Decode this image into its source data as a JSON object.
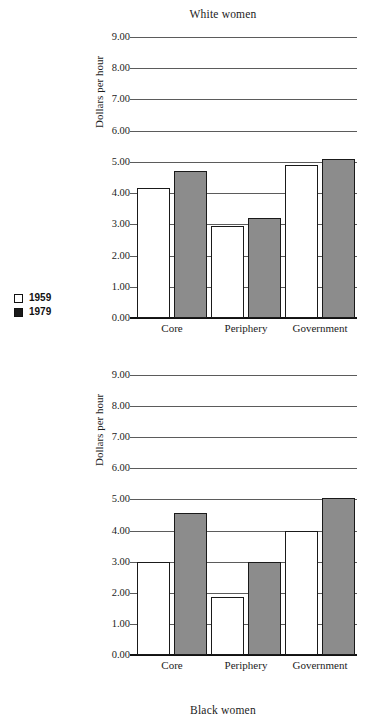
{
  "legend": {
    "entries": [
      {
        "label": "1959",
        "swatch": "open-square-icon",
        "fill": "#ffffff"
      },
      {
        "label": "1979",
        "swatch": "filled-square-icon",
        "fill": "#1a1a1a"
      }
    ]
  },
  "chart_data": [
    {
      "type": "bar",
      "title": "White women",
      "xlabel": "",
      "ylabel": "Dollars per hour",
      "categories": [
        "Core",
        "Periphery",
        "Government"
      ],
      "series": [
        {
          "name": "1959",
          "values": [
            4.15,
            2.95,
            4.9
          ]
        },
        {
          "name": "1979",
          "values": [
            4.7,
            3.2,
            5.1
          ]
        }
      ],
      "ylim": [
        0,
        9
      ],
      "ytick_step": 1,
      "ytick_labels": [
        "0.00",
        "1.00",
        "2.00",
        "3.00",
        "4.00",
        "5.00",
        "6.00",
        "7.00",
        "8.00",
        "9.00"
      ],
      "grid": true,
      "legend_position": "left-outside"
    },
    {
      "type": "bar",
      "title": "Black women",
      "xlabel": "",
      "ylabel": "Dollars per hour",
      "categories": [
        "Core",
        "Periphery",
        "Government"
      ],
      "series": [
        {
          "name": "1959",
          "values": [
            3.0,
            1.85,
            4.0
          ]
        },
        {
          "name": "1979",
          "values": [
            4.55,
            3.0,
            5.05
          ]
        }
      ],
      "ylim": [
        0,
        9
      ],
      "ytick_step": 1,
      "ytick_labels": [
        "0.00",
        "1.00",
        "2.00",
        "3.00",
        "4.00",
        "5.00",
        "6.00",
        "7.00",
        "8.00",
        "9.00"
      ],
      "grid": true,
      "legend_position": "left-outside"
    }
  ]
}
